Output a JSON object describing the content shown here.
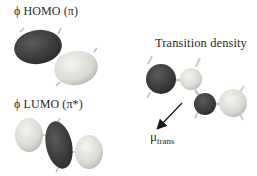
{
  "figure": {
    "panels": [
      {
        "id": "homo",
        "label": "ϕ HOMO (π)"
      },
      {
        "id": "lumo",
        "label": "ϕ LUMO (π*)"
      },
      {
        "id": "transition-density",
        "label": "Transition density"
      }
    ],
    "dipole": {
      "symbol": "μ",
      "subscript": "trans"
    }
  },
  "colors": {
    "dark_lobe": "#3e3e3e",
    "light_lobe": "#dcdcd6",
    "bond": "#c8c8c8",
    "text": "#2a2a2a"
  }
}
